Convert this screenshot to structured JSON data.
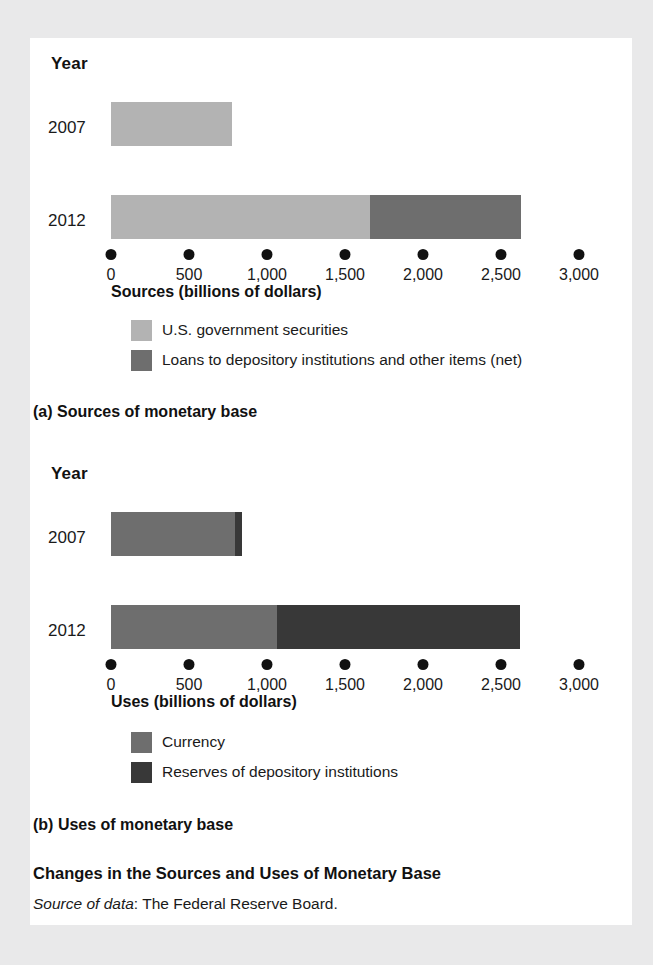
{
  "figure": {
    "title": "Changes in the Sources and Uses of Monetary Base",
    "source_prefix": "Source of data",
    "source_text": ": The Federal Reserve Board."
  },
  "colors": {
    "light_gray": "#b3b3b3",
    "mid_gray": "#6e6e6e",
    "dark_gray": "#383838",
    "panel_bg": "#ffffff",
    "page_bg": "#e9e9ea",
    "text": "#1a1a1a"
  },
  "panel_a": {
    "caption": "(a) Sources of monetary base",
    "year_heading": "Year",
    "axis_title": "Sources (billions of dollars)",
    "tick_labels": [
      "0",
      "500",
      "1,000",
      "1,500",
      "2,000",
      "2,500",
      "3,000"
    ],
    "legend": [
      {
        "label": "U.S. government securities",
        "color": "#b3b3b3"
      },
      {
        "label": "Loans to depository institutions and other items (net)",
        "color": "#6e6e6e"
      }
    ]
  },
  "panel_b": {
    "caption": "(b) Uses of monetary base",
    "year_heading": "Year",
    "axis_title": "Uses (billions of dollars)",
    "tick_labels": [
      "0",
      "500",
      "1,000",
      "1,500",
      "2,000",
      "2,500",
      "3,000"
    ],
    "legend": [
      {
        "label": "Currency",
        "color": "#6e6e6e"
      },
      {
        "label": "Reserves of depository institutions",
        "color": "#383838"
      }
    ]
  },
  "chart_data": [
    {
      "type": "bar",
      "orientation": "horizontal",
      "stacked": true,
      "title": "(a) Sources of monetary base",
      "xlabel": "Sources (billions of dollars)",
      "ylabel": "Year",
      "xlim": [
        0,
        3000
      ],
      "xticks": [
        0,
        500,
        1000,
        1500,
        2000,
        2500,
        3000
      ],
      "xticklabels": [
        "0",
        "500",
        "1,000",
        "1,500",
        "2,000",
        "2,500",
        "3,000"
      ],
      "grid": false,
      "legend_position": "below-axis",
      "categories": [
        "2007",
        "2012"
      ],
      "series": [
        {
          "name": "U.S. government securities",
          "color": "#b3b3b3",
          "values": [
            775,
            1660
          ]
        },
        {
          "name": "Loans to depository institutions and other items (net)",
          "color": "#6e6e6e",
          "values": [
            0,
            970
          ]
        }
      ],
      "totals": [
        775,
        2630
      ]
    },
    {
      "type": "bar",
      "orientation": "horizontal",
      "stacked": true,
      "title": "(b) Uses of monetary base",
      "xlabel": "Uses (billions of dollars)",
      "ylabel": "Year",
      "xlim": [
        0,
        3000
      ],
      "xticks": [
        0,
        500,
        1000,
        1500,
        2000,
        2500,
        3000
      ],
      "xticklabels": [
        "0",
        "500",
        "1,000",
        "1,500",
        "2,000",
        "2,500",
        "3,000"
      ],
      "grid": false,
      "legend_position": "below-axis",
      "categories": [
        "2007",
        "2012"
      ],
      "series": [
        {
          "name": "Currency",
          "color": "#6e6e6e",
          "values": [
            795,
            1065
          ]
        },
        {
          "name": "Reserves of depository institutions",
          "color": "#383838",
          "values": [
            45,
            1555
          ]
        }
      ],
      "totals": [
        840,
        2620
      ]
    }
  ]
}
